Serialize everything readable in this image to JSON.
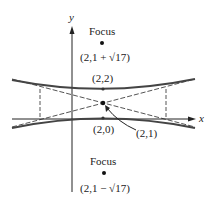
{
  "diagram": {
    "type": "hyperbola",
    "axes": {
      "x_label": "x",
      "y_label": "y"
    },
    "points": {
      "upper_focus": {
        "label": "Focus",
        "coord": "(2,1 + √17)"
      },
      "upper_vertex": {
        "coord": "(2,2)"
      },
      "center": {
        "coord": "(2,1)"
      },
      "lower_vertex": {
        "coord": "(2,0)"
      },
      "lower_focus": {
        "label": "Focus",
        "coord": "(2,1 − √17)"
      }
    },
    "colors": {
      "curve": "#444444",
      "dashed": "#555555",
      "axis": "#222222"
    }
  }
}
